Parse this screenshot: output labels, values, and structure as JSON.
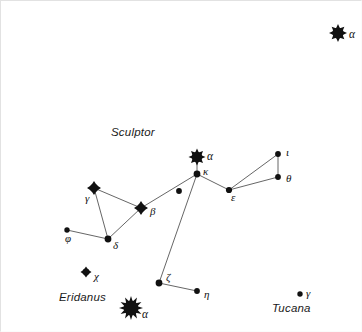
{
  "figure": {
    "kind": "star-chart",
    "width": 362,
    "height": 332,
    "background_color": "#ffffff",
    "ink_color": "#111111",
    "line_color": "#555555"
  },
  "constellation_names": [
    {
      "id": "sculptor",
      "text": "Sculptor",
      "x": 110,
      "y": 125
    },
    {
      "id": "eridanus",
      "text": "Eridanus",
      "x": 58,
      "y": 290
    },
    {
      "id": "tucana",
      "text": "Tucana",
      "x": 271,
      "y": 301
    }
  ],
  "stars": [
    {
      "id": "alpha-phoenicis",
      "label": "α",
      "glyph": "spiked-star",
      "x": 337,
      "y": 32,
      "size": 9,
      "spikes": 8,
      "label_x": 348,
      "label_y": 38
    },
    {
      "id": "alpha-sculptoris",
      "label": "α",
      "glyph": "spiked-star",
      "x": 196,
      "y": 156,
      "size": 8.5,
      "spikes": 8,
      "label_x": 206,
      "label_y": 160
    },
    {
      "id": "kappa-sculptoris",
      "label": "κ",
      "glyph": "dot",
      "x": 196,
      "y": 173,
      "size": 3.4,
      "label_x": 202,
      "label_y": 175
    },
    {
      "id": "iota-sculptoris",
      "label": "ι",
      "glyph": "dot",
      "x": 277,
      "y": 153,
      "size": 2.9,
      "label_x": 285,
      "label_y": 156
    },
    {
      "id": "theta-sculptoris",
      "label": "θ",
      "glyph": "dot",
      "x": 277,
      "y": 176,
      "size": 2.9,
      "label_x": 285,
      "label_y": 182
    },
    {
      "id": "epsilon-sculptoris",
      "label": "ε",
      "glyph": "dot",
      "x": 228,
      "y": 189,
      "size": 3.1,
      "label_x": 230,
      "label_y": 201
    },
    {
      "id": "unnamed-sculptoris",
      "label": "",
      "glyph": "dot",
      "x": 178,
      "y": 190,
      "size": 2.9,
      "label_x": 0,
      "label_y": 0
    },
    {
      "id": "gamma-sculptoris",
      "label": "γ",
      "glyph": "diamond-star",
      "x": 93,
      "y": 187,
      "size": 7,
      "spikes": 4,
      "label_x": 84,
      "label_y": 202
    },
    {
      "id": "beta-sculptoris",
      "label": "β",
      "glyph": "diamond-star",
      "x": 140,
      "y": 207,
      "size": 7,
      "spikes": 4,
      "label_x": 149,
      "label_y": 215
    },
    {
      "id": "delta-sculptoris",
      "label": "δ",
      "glyph": "dot",
      "x": 107,
      "y": 238,
      "size": 3.4,
      "label_x": 112,
      "label_y": 249
    },
    {
      "id": "phi-sculptoris",
      "label": "φ",
      "glyph": "dot",
      "x": 66,
      "y": 229,
      "size": 2.7,
      "label_x": 64,
      "label_y": 242
    },
    {
      "id": "zeta-sculptoris",
      "label": "ζ",
      "glyph": "dot",
      "x": 158,
      "y": 282,
      "size": 3.4,
      "label_x": 165,
      "label_y": 281
    },
    {
      "id": "eta-sculptoris",
      "label": "η",
      "glyph": "dot",
      "x": 196,
      "y": 290,
      "size": 2.9,
      "label_x": 203,
      "label_y": 298
    },
    {
      "id": "chi-eridani",
      "label": "χ",
      "glyph": "diamond-star",
      "x": 85,
      "y": 271,
      "size": 5.5,
      "spikes": 4,
      "label_x": 93,
      "label_y": 280
    },
    {
      "id": "alpha-eridani",
      "label": "α",
      "glyph": "spiked-star",
      "x": 130,
      "y": 307,
      "size": 12,
      "spikes": 12,
      "label_x": 141,
      "label_y": 318
    },
    {
      "id": "gamma-tucanae",
      "label": "γ",
      "glyph": "dot",
      "x": 299,
      "y": 293,
      "size": 2.7,
      "label_x": 305,
      "label_y": 297
    }
  ],
  "constellation_lines": [
    {
      "from": "alpha-sculptoris",
      "to": "kappa-sculptoris"
    },
    {
      "from": "kappa-sculptoris",
      "to": "epsilon-sculptoris"
    },
    {
      "from": "epsilon-sculptoris",
      "to": "iota-sculptoris"
    },
    {
      "from": "epsilon-sculptoris",
      "to": "theta-sculptoris"
    },
    {
      "from": "iota-sculptoris",
      "to": "theta-sculptoris"
    },
    {
      "from": "kappa-sculptoris",
      "to": "beta-sculptoris"
    },
    {
      "from": "kappa-sculptoris",
      "to": "zeta-sculptoris"
    },
    {
      "from": "zeta-sculptoris",
      "to": "eta-sculptoris"
    },
    {
      "from": "beta-sculptoris",
      "to": "gamma-sculptoris"
    },
    {
      "from": "beta-sculptoris",
      "to": "delta-sculptoris"
    },
    {
      "from": "gamma-sculptoris",
      "to": "delta-sculptoris"
    },
    {
      "from": "delta-sculptoris",
      "to": "phi-sculptoris"
    }
  ]
}
